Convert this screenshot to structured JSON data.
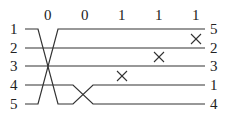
{
  "diagram": {
    "type": "sorting-network / permutation wiring",
    "column_bits": [
      "0",
      "0",
      "1",
      "1",
      "1"
    ],
    "left_labels": [
      "1",
      "2",
      "3",
      "4",
      "5"
    ],
    "right_labels": [
      "5",
      "2",
      "3",
      "1",
      "4"
    ],
    "x_marks": [
      {
        "column": 3,
        "between_wires": [
          3,
          4
        ]
      },
      {
        "column": 4,
        "between_wires": [
          2,
          3
        ]
      },
      {
        "column": 5,
        "between_wires": [
          1,
          2
        ]
      }
    ],
    "line_color": "#333333"
  }
}
